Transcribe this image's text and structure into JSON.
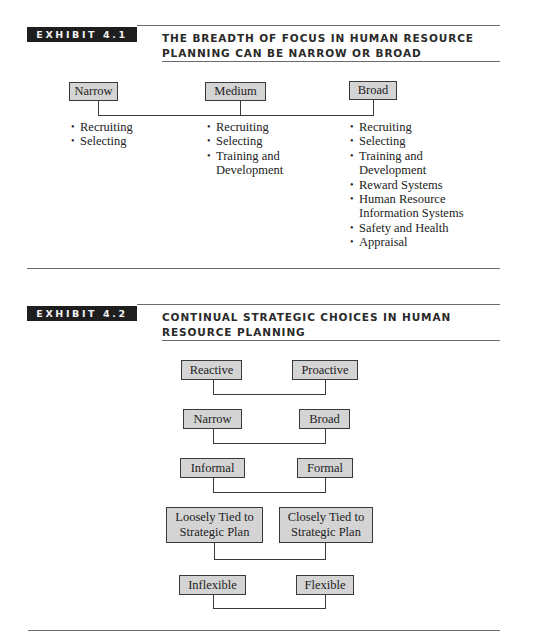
{
  "exhibit_1": {
    "label": "EXHIBIT 4.1",
    "title_line1": "The Breadth of Focus in Human Resource",
    "title_line2": "Planning Can Be Narrow or Broad",
    "columns": [
      {
        "label": "Narrow",
        "items": [
          "Recruiting",
          "Selecting"
        ]
      },
      {
        "label": "Medium",
        "items": [
          "Recruiting",
          "Selecting",
          "Training and Development"
        ]
      },
      {
        "label": "Broad",
        "items": [
          "Recruiting",
          "Selecting",
          "Training and Development",
          "Reward Systems",
          "Human Resource Information Systems",
          "Safety and Health",
          "Appraisal"
        ]
      }
    ]
  },
  "exhibit_2": {
    "label": "EXHIBIT 4.2",
    "title_line1": "Continual Strategic Choices in Human",
    "title_line2": "Resource Planning",
    "pairs": [
      {
        "left": "Reactive",
        "right": "Proactive"
      },
      {
        "left": "Narrow",
        "right": "Broad"
      },
      {
        "left": "Informal",
        "right": "Formal"
      },
      {
        "left": "Loosely Tied to Strategic Plan",
        "right": "Closely Tied to Strategic Plan"
      },
      {
        "left": "Inflexible",
        "right": "Flexible"
      }
    ]
  },
  "colors": {
    "label_bg": "#1e1e1e",
    "box_fill": "#d4d4d4",
    "line": "#3a3a3a"
  }
}
